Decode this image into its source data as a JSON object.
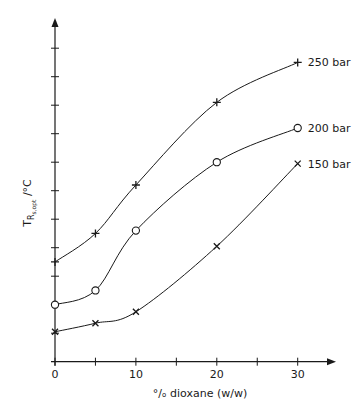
{
  "chart_data": {
    "type": "line",
    "title": "",
    "xlabel": "°/ₒ dioxane (w/w)",
    "ylabel": "T_R_s,opt /°C",
    "ylabel_parts": {
      "main": "T",
      "sub": "R",
      "subsub": "s,opt",
      "unit": " /°C"
    },
    "x_ticks": [
      0,
      5,
      10,
      15,
      20,
      25,
      30
    ],
    "x_tick_labels": [
      "0",
      "10",
      "20",
      "30"
    ],
    "x_tick_label_values": [
      0,
      10,
      20,
      30
    ],
    "xlim": [
      0,
      34.5
    ],
    "y_tick_count": 11,
    "y_tick_labels": [],
    "ylim_ticks": [
      0,
      11.2
    ],
    "y_units_note": "values in y-axis tick units (axis unlabeled)",
    "grid": false,
    "legend": "inline labels at right end of each curve",
    "x": [
      0,
      5,
      10,
      20,
      30
    ],
    "series": [
      {
        "name": "250 bar",
        "marker": "plus",
        "values": [
          3.5,
          4.5,
          6.2,
          9.1,
          10.5
        ]
      },
      {
        "name": "200 bar",
        "marker": "circle",
        "values": [
          2.0,
          2.5,
          4.6,
          7.0,
          8.2
        ]
      },
      {
        "name": "150 bar",
        "marker": "cross",
        "values": [
          1.05,
          1.35,
          1.75,
          4.05,
          6.95
        ]
      }
    ]
  },
  "colors": {
    "ink": "#1a1a1a",
    "background": "#ffffff"
  }
}
